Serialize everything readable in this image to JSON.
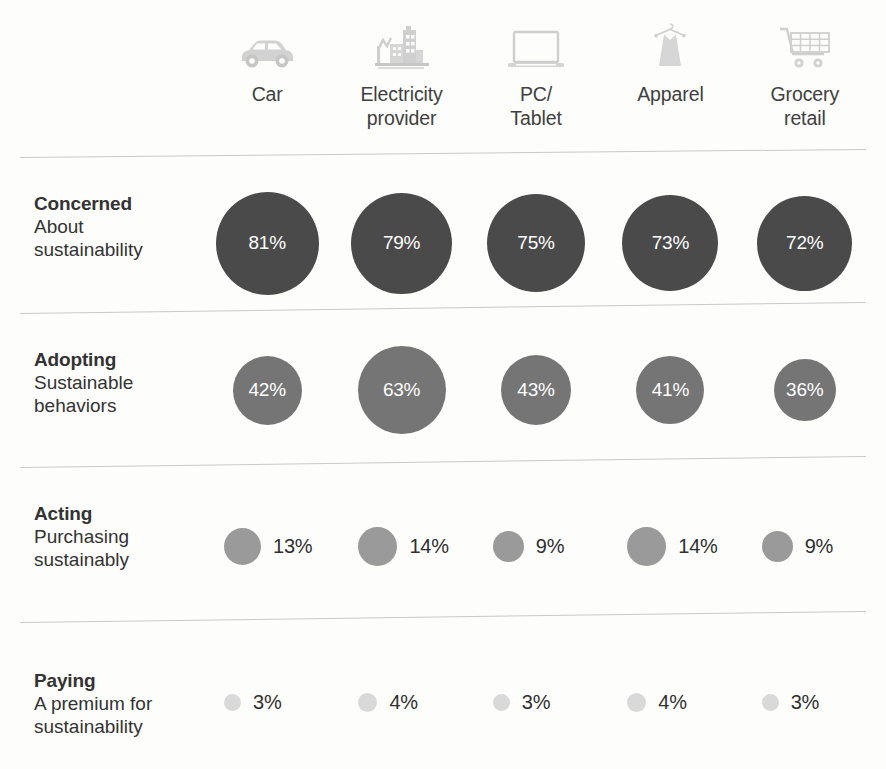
{
  "chart_data": {
    "type": "bar",
    "title": "",
    "subtitle": "",
    "xlabel": "",
    "ylabel": "",
    "legend_position": "none",
    "grid": false,
    "categories": [
      "Car",
      "Electricity provider",
      "PC/ Tablet",
      "Apparel",
      "Grocery retail"
    ],
    "series": [
      {
        "name": "Concerned",
        "values": [
          81,
          79,
          75,
          73,
          72
        ]
      },
      {
        "name": "Adopting",
        "values": [
          42,
          63,
          43,
          41,
          36
        ]
      },
      {
        "name": "Acting",
        "values": [
          13,
          14,
          9,
          14,
          9
        ]
      },
      {
        "name": "Paying",
        "values": [
          3,
          4,
          3,
          4,
          3
        ]
      }
    ],
    "units": "percent"
  },
  "columns": [
    {
      "label": "Car",
      "icon": "car-icon"
    },
    {
      "label": "Electricity\nprovider",
      "icon": "factory-icon"
    },
    {
      "label": "PC/\nTablet",
      "icon": "laptop-icon"
    },
    {
      "label": "Apparel",
      "icon": "dress-icon"
    },
    {
      "label": "Grocery\nretail",
      "icon": "shopping-cart-icon"
    }
  ],
  "rows": [
    {
      "lead": "Concerned",
      "sub": "About\nsustainability",
      "color": "#4a4a4a",
      "label_placement": "inside",
      "top": 178,
      "height": 130,
      "label_top": 14,
      "cells": [
        {
          "value": "81%",
          "diameter": 103
        },
        {
          "value": "79%",
          "diameter": 101
        },
        {
          "value": "75%",
          "diameter": 98
        },
        {
          "value": "73%",
          "diameter": 96
        },
        {
          "value": "72%",
          "diameter": 95
        }
      ]
    },
    {
      "lead": "Adopting",
      "sub": "Sustainable\nbehaviors",
      "color": "#757575",
      "label_placement": "inside",
      "top": 334,
      "height": 112,
      "label_top": 14,
      "cells": [
        {
          "value": "42%",
          "diameter": 69
        },
        {
          "value": "63%",
          "diameter": 88
        },
        {
          "value": "43%",
          "diameter": 70
        },
        {
          "value": "41%",
          "diameter": 68
        },
        {
          "value": "36%",
          "diameter": 62
        }
      ]
    },
    {
      "lead": "Acting",
      "sub": "Purchasing\nsustainably",
      "color": "#9a9a9a",
      "label_placement": "outside",
      "top": 496,
      "height": 100,
      "label_top": 6,
      "cells": [
        {
          "value": "13%",
          "diameter": 37
        },
        {
          "value": "14%",
          "diameter": 39
        },
        {
          "value": "9%",
          "diameter": 31
        },
        {
          "value": "14%",
          "diameter": 39
        },
        {
          "value": "9%",
          "diameter": 31
        }
      ]
    },
    {
      "lead": "Paying",
      "sub": "A premium for\nsustainability",
      "color": "#d9d9d9",
      "label_placement": "outside",
      "top": 655,
      "height": 95,
      "label_top": 14,
      "cells": [
        {
          "value": "3%",
          "diameter": 17
        },
        {
          "value": "4%",
          "diameter": 19
        },
        {
          "value": "3%",
          "diameter": 17
        },
        {
          "value": "4%",
          "diameter": 19
        },
        {
          "value": "3%",
          "diameter": 17
        }
      ]
    }
  ],
  "rules": [
    {
      "top": 157,
      "skew": -0.55
    },
    {
      "top": 313,
      "skew": -0.75
    },
    {
      "top": 467,
      "skew": -0.75
    },
    {
      "top": 622,
      "skew": -0.75
    }
  ],
  "colors": {
    "background": "#fdfdfb",
    "rule": "#c9c9c9",
    "icon": "#cfcfcf",
    "text": "#333333",
    "value_inside": "#ffffff",
    "value_outside": "#2f2f2f"
  }
}
